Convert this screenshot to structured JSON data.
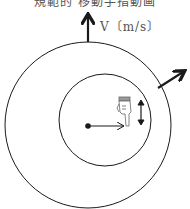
{
  "diagram": {
    "title_partial": "規範的 移動手指動画",
    "velocity_label": "V〔m/s〕",
    "outer_circle": {
      "cx": 88,
      "cy": 125,
      "r": 83
    },
    "inner_circle": {
      "cx": 105,
      "cy": 120,
      "r": 46
    },
    "center_dot": {
      "cx": 88,
      "cy": 126
    },
    "radius_arrow": {
      "from": [
        88,
        126
      ],
      "to": [
        124,
        126
      ]
    },
    "velocity_arrow_up": {
      "from": [
        88,
        42
      ],
      "to": [
        88,
        14
      ]
    },
    "velocity_arrow_diag": {
      "from": [
        158,
        88
      ],
      "to": [
        186,
        71
      ]
    },
    "hand_icon": "pointing-hand-down",
    "updown_arrow_icon": "up-down-arrow",
    "colors": {
      "stroke": "#1a1a1a",
      "label": "#555555",
      "background": "#ffffff"
    }
  }
}
